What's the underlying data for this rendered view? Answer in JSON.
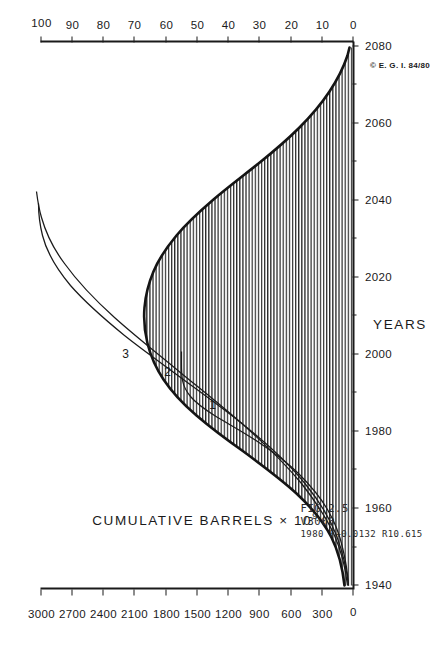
{
  "figure": {
    "fig_number": "FIG.2.5",
    "model_code": "V3000",
    "model_params": "1980 F+0.0132 R10.615",
    "copyright": "© E. G. I.  84/80"
  },
  "chart_data": {
    "type": "line",
    "title": "",
    "orientation": "rotated-90-ccw",
    "xlabel": "YEARS",
    "ylabel": "CUMULATIVE  BARRELS  × 10⁹",
    "y2label": "ANNUAL  BARRELS  × 10⁹",
    "grid": false,
    "legend_position": "inline-curve-labels",
    "xlim": [
      1940,
      2085
    ],
    "ylim": [
      0,
      3000
    ],
    "y2lim": [
      0,
      100
    ],
    "x_ticks": [
      1940,
      1960,
      1980,
      2000,
      2020,
      2040,
      2060,
      2080
    ],
    "x_minor_interval": 5,
    "y_ticks": [
      0,
      300,
      600,
      900,
      1200,
      1500,
      1800,
      2100,
      2400,
      2700,
      3000
    ],
    "y2_ticks": [
      0,
      10,
      20,
      30,
      40,
      50,
      60,
      70,
      80,
      90,
      100
    ],
    "x_tick_labels": [
      "1940",
      "1960",
      "1980",
      "2000",
      "2020",
      "2040",
      "2060",
      "2080"
    ],
    "y_tick_labels": [
      "0",
      "300",
      "600",
      "900",
      "1200",
      "1500",
      "1800",
      "2100",
      "2400",
      "2700",
      "3000"
    ],
    "y2_tick_labels": [
      "0",
      "10",
      "20",
      "30",
      "40",
      "50",
      "60",
      "70",
      "80",
      "90",
      "100"
    ],
    "series": [
      {
        "name": "1",
        "label": "1",
        "axis": "left",
        "style": "thin-line",
        "description": "Cumulative production, historical and low projection",
        "x": [
          1940,
          1945,
          1950,
          1955,
          1960,
          1965,
          1970,
          1975,
          1980,
          1985,
          1990,
          1995,
          2000,
          2005,
          2010,
          2015,
          2020
        ],
        "values": [
          40,
          60,
          90,
          140,
          210,
          310,
          450,
          620,
          800,
          930,
          1010,
          1070,
          1120,
          1160,
          1190,
          1210,
          1225
        ]
      },
      {
        "name": "2",
        "label": "2",
        "axis": "left",
        "style": "thin-line",
        "description": "Cumulative production, middle projection to ultimate ~3000",
        "x": [
          1940,
          1950,
          1960,
          1970,
          1980,
          1990,
          2000,
          2010,
          2020,
          2030,
          2040,
          2050,
          2060,
          2070,
          2080
        ],
        "values": [
          40,
          90,
          210,
          450,
          800,
          1150,
          1500,
          1840,
          2130,
          2370,
          2560,
          2700,
          2800,
          2870,
          2915
        ]
      },
      {
        "name": "3",
        "label": "3",
        "axis": "left",
        "style": "thin-line",
        "description": "Cumulative production, high projection to ultimate ~3000",
        "x": [
          1940,
          1950,
          1960,
          1970,
          1980,
          1990,
          2000,
          2010,
          2020,
          2030,
          2040,
          2050,
          2060,
          2070,
          2080
        ],
        "values": [
          40,
          90,
          215,
          460,
          830,
          1230,
          1620,
          1980,
          2270,
          2500,
          2670,
          2790,
          2875,
          2930,
          2960
        ]
      },
      {
        "name": "annual-production",
        "label": "",
        "axis": "right",
        "style": "hatched-area",
        "description": "Annual production rate, hatched bell curve peaking near 2000 at ~33",
        "x": [
          1940,
          1945,
          1950,
          1955,
          1960,
          1965,
          1970,
          1975,
          1980,
          1985,
          1990,
          1995,
          2000,
          2005,
          2010,
          2015,
          2020,
          2025,
          2030,
          2035,
          2040,
          2045,
          2050,
          2055,
          2060,
          2065,
          2070,
          2075,
          2080
        ],
        "values": [
          2.5,
          3.5,
          5.0,
          7.5,
          11.0,
          15.5,
          20.5,
          25.0,
          28.5,
          31.0,
          32.5,
          33.0,
          32.8,
          31.5,
          29.5,
          27.0,
          24.0,
          21.0,
          18.0,
          15.3,
          12.8,
          10.6,
          8.7,
          7.0,
          5.6,
          4.4,
          3.4,
          2.6,
          2.0
        ]
      },
      {
        "name": "annual-historical",
        "label": "",
        "axis": "right",
        "style": "heavy-line",
        "description": "Heavy line bounding the annual production curve",
        "x": [
          1940,
          1950,
          1960,
          1970,
          1980,
          1990,
          2000,
          2010,
          2020,
          2030,
          2040,
          2050,
          2060,
          2070,
          2080
        ],
        "values": [
          2.5,
          5.0,
          11.0,
          20.5,
          28.5,
          32.5,
          32.8,
          29.5,
          24.0,
          18.0,
          12.8,
          8.7,
          5.6,
          3.4,
          2.0
        ]
      }
    ],
    "annotations": [
      {
        "text": "1",
        "x": 1988,
        "note": "curve-1-label"
      },
      {
        "text": "2",
        "x": 2002,
        "note": "curve-2-label"
      },
      {
        "text": "3",
        "x": 2008,
        "note": "curve-3-label"
      }
    ]
  }
}
